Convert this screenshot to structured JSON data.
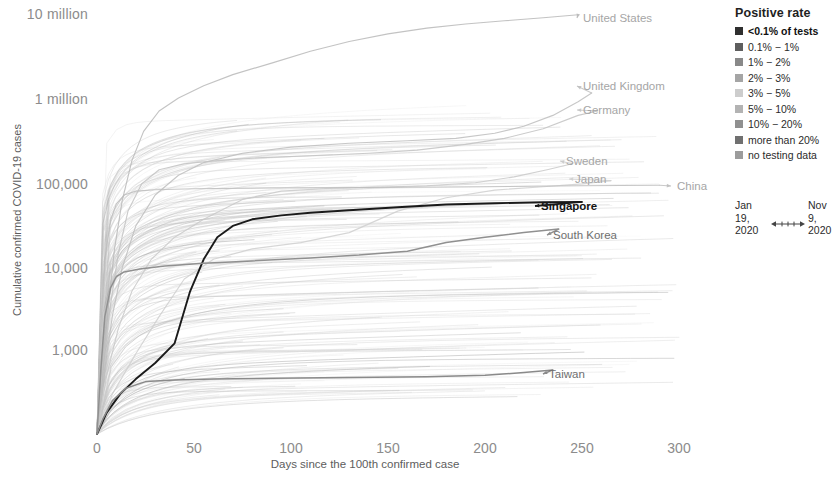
{
  "chart_data": {
    "type": "line",
    "title": "",
    "xlabel": "Days since the 100th confirmed case",
    "ylabel": "Cumulative confirmed COVID-19 cases",
    "yscale": "log",
    "ylim": [
      100,
      10000000
    ],
    "xlim": [
      0,
      310
    ],
    "grid": false,
    "xticks": [
      "0",
      "50",
      "100",
      "150",
      "200",
      "250",
      "300"
    ],
    "xtick_values": [
      0,
      50,
      100,
      150,
      200,
      250,
      300
    ],
    "yticks": [
      "1,000",
      "10,000",
      "100,000",
      "1 million",
      "10 million"
    ],
    "ytick_values": [
      1000,
      10000,
      100000,
      1000000,
      10000000
    ],
    "series": [
      {
        "name": "United States",
        "label": "United States",
        "emphasis": "light",
        "color": "#b9b9b9",
        "label_x": 583,
        "label_y": 12,
        "points": [
          [
            0,
            100
          ],
          [
            3,
            600
          ],
          [
            6,
            3500
          ],
          [
            9,
            16000
          ],
          [
            13,
            60000
          ],
          [
            18,
            180000
          ],
          [
            24,
            400000
          ],
          [
            32,
            700000
          ],
          [
            42,
            1000000
          ],
          [
            55,
            1400000
          ],
          [
            70,
            1900000
          ],
          [
            90,
            2600000
          ],
          [
            110,
            3600000
          ],
          [
            130,
            4700000
          ],
          [
            150,
            5800000
          ],
          [
            170,
            6800000
          ],
          [
            190,
            7600000
          ],
          [
            210,
            8300000
          ],
          [
            230,
            9000000
          ],
          [
            248,
            9800000
          ]
        ]
      },
      {
        "name": "United Kingdom",
        "label": "United Kingdom",
        "emphasis": "light",
        "color": "#bdbdbd",
        "label_x": 583,
        "label_y": 80,
        "points": [
          [
            0,
            100
          ],
          [
            4,
            600
          ],
          [
            8,
            2600
          ],
          [
            13,
            9500
          ],
          [
            20,
            30000
          ],
          [
            30,
            70000
          ],
          [
            42,
            120000
          ],
          [
            55,
            170000
          ],
          [
            75,
            220000
          ],
          [
            100,
            260000
          ],
          [
            130,
            290000
          ],
          [
            160,
            310000
          ],
          [
            185,
            330000
          ],
          [
            205,
            380000
          ],
          [
            220,
            460000
          ],
          [
            235,
            620000
          ],
          [
            248,
            900000
          ],
          [
            255,
            1150000
          ]
        ]
      },
      {
        "name": "Germany",
        "label": "Germany",
        "emphasis": "light",
        "color": "#c2c2c2",
        "label_x": 583,
        "label_y": 104,
        "points": [
          [
            0,
            100
          ],
          [
            3,
            700
          ],
          [
            7,
            3500
          ],
          [
            11,
            14000
          ],
          [
            16,
            45000
          ],
          [
            23,
            95000
          ],
          [
            32,
            140000
          ],
          [
            45,
            165000
          ],
          [
            62,
            180000
          ],
          [
            85,
            195000
          ],
          [
            110,
            205000
          ],
          [
            140,
            220000
          ],
          [
            165,
            240000
          ],
          [
            190,
            280000
          ],
          [
            210,
            330000
          ],
          [
            230,
            430000
          ],
          [
            248,
            620000
          ],
          [
            258,
            700000
          ]
        ]
      },
      {
        "name": "Sweden",
        "label": "Sweden",
        "emphasis": "light",
        "color": "#c9c9c9",
        "label_x": 566,
        "label_y": 155,
        "points": [
          [
            0,
            100
          ],
          [
            5,
            500
          ],
          [
            11,
            1800
          ],
          [
            18,
            5000
          ],
          [
            28,
            12000
          ],
          [
            40,
            22000
          ],
          [
            55,
            36000
          ],
          [
            75,
            62000
          ],
          [
            95,
            78000
          ],
          [
            120,
            84000
          ],
          [
            145,
            87000
          ],
          [
            170,
            90000
          ],
          [
            195,
            98000
          ],
          [
            215,
            115000
          ],
          [
            232,
            140000
          ],
          [
            245,
            165000
          ]
        ]
      },
      {
        "name": "Japan",
        "label": "Japan",
        "emphasis": "light",
        "color": "#cfcfcf",
        "label_x": 575,
        "label_y": 173,
        "points": [
          [
            0,
            100
          ],
          [
            8,
            300
          ],
          [
            20,
            900
          ],
          [
            32,
            2500
          ],
          [
            45,
            7000
          ],
          [
            60,
            12000
          ],
          [
            80,
            16000
          ],
          [
            105,
            19000
          ],
          [
            130,
            25000
          ],
          [
            155,
            45000
          ],
          [
            180,
            65000
          ],
          [
            205,
            80000
          ],
          [
            230,
            88000
          ],
          [
            250,
            95000
          ],
          [
            265,
            104000
          ]
        ]
      },
      {
        "name": "China",
        "label": "China",
        "emphasis": "light",
        "color": "#bcbcbc",
        "label_x": 677,
        "label_y": 180,
        "points": [
          [
            0,
            100
          ],
          [
            2,
            2000
          ],
          [
            4,
            12000
          ],
          [
            7,
            35000
          ],
          [
            10,
            55000
          ],
          [
            14,
            70000
          ],
          [
            20,
            78000
          ],
          [
            30,
            81000
          ],
          [
            50,
            83000
          ],
          [
            90,
            85000
          ],
          [
            140,
            86000
          ],
          [
            200,
            88000
          ],
          [
            250,
            90000
          ],
          [
            290,
            91500
          ]
        ]
      },
      {
        "name": "Singapore",
        "label": "Singapore",
        "emphasis": "bold",
        "color": "#1a1a1a",
        "label_x": 541,
        "label_y": 200,
        "points": [
          [
            0,
            100
          ],
          [
            5,
            180
          ],
          [
            12,
            300
          ],
          [
            20,
            450
          ],
          [
            30,
            700
          ],
          [
            40,
            1200
          ],
          [
            48,
            5000
          ],
          [
            55,
            12000
          ],
          [
            62,
            22000
          ],
          [
            70,
            30000
          ],
          [
            80,
            36000
          ],
          [
            95,
            40000
          ],
          [
            110,
            43000
          ],
          [
            130,
            46000
          ],
          [
            155,
            50000
          ],
          [
            180,
            54000
          ],
          [
            205,
            56000
          ],
          [
            230,
            57500
          ],
          [
            250,
            58000
          ]
        ]
      },
      {
        "name": "South Korea",
        "label": "South Korea",
        "emphasis": "medium",
        "color": "#909090",
        "label_x": 553,
        "label_y": 229,
        "points": [
          [
            0,
            100
          ],
          [
            2,
            600
          ],
          [
            4,
            2500
          ],
          [
            7,
            5500
          ],
          [
            10,
            7500
          ],
          [
            14,
            8500
          ],
          [
            22,
            9200
          ],
          [
            35,
            10000
          ],
          [
            55,
            10800
          ],
          [
            80,
            11500
          ],
          [
            110,
            12500
          ],
          [
            135,
            13500
          ],
          [
            160,
            15000
          ],
          [
            180,
            19000
          ],
          [
            200,
            22000
          ],
          [
            220,
            25000
          ],
          [
            238,
            27500
          ]
        ]
      },
      {
        "name": "Taiwan",
        "label": "Taiwan",
        "emphasis": "medium",
        "color": "#8a8a8a",
        "label_x": 549,
        "label_y": 368,
        "points": [
          [
            0,
            100
          ],
          [
            3,
            150
          ],
          [
            8,
            250
          ],
          [
            15,
            350
          ],
          [
            25,
            420
          ],
          [
            40,
            440
          ],
          [
            60,
            450
          ],
          [
            90,
            460
          ],
          [
            130,
            470
          ],
          [
            170,
            480
          ],
          [
            200,
            500
          ],
          [
            220,
            540
          ],
          [
            235,
            580
          ]
        ]
      }
    ],
    "background_series_note": "hundreds of faint grey country trajectories",
    "annotation_arrows": true
  },
  "legend": {
    "title": "Positive rate",
    "items": [
      {
        "label": "<0.1% of tests",
        "color": "#2f2f2f"
      },
      {
        "label": "0.1% − 1%",
        "color": "#5e5e5e"
      },
      {
        "label": "1% − 2%",
        "color": "#898989"
      },
      {
        "label": "2% − 3%",
        "color": "#a5a5a5"
      },
      {
        "label": "3% − 5%",
        "color": "#cdcdcd"
      },
      {
        "label": "5% − 10%",
        "color": "#b3b3b3"
      },
      {
        "label": "10% − 20%",
        "color": "#909090"
      },
      {
        "label": "more than 20%",
        "color": "#707070"
      },
      {
        "label": "no testing data",
        "color": "#9c9c9c"
      }
    ]
  },
  "date_range": {
    "start_line1": "Jan",
    "start_line2": "19,",
    "start_line3": "2020",
    "end_line1": "Nov",
    "end_line2": "9,",
    "end_line3": "2020"
  }
}
